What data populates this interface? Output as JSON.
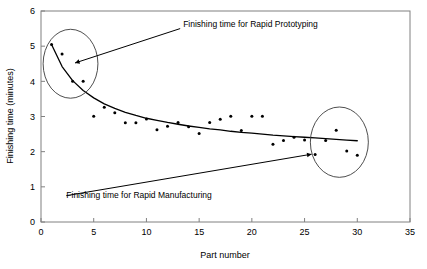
{
  "chart_data": {
    "type": "scatter",
    "title": "",
    "xlabel": "Part number",
    "ylabel": "Finishing time (minutes)",
    "xlim": [
      0,
      35
    ],
    "ylim": [
      0,
      6
    ],
    "xticks": [
      0,
      5,
      10,
      15,
      20,
      25,
      30,
      35
    ],
    "yticks": [
      0,
      1,
      2,
      3,
      4,
      5,
      6
    ],
    "grid": false,
    "legend": "none",
    "series": [
      {
        "name": "Finishing time",
        "marker": "point",
        "color": "#000000",
        "x": [
          1,
          2,
          3,
          4,
          5,
          6,
          7,
          8,
          9,
          10,
          11,
          12,
          13,
          14,
          15,
          16,
          17,
          18,
          19,
          20,
          21,
          22,
          23,
          24,
          25,
          26,
          27,
          28,
          29,
          30
        ],
        "y": [
          5.05,
          4.78,
          4.0,
          4.0,
          3.01,
          3.26,
          3.11,
          2.82,
          2.82,
          2.93,
          2.62,
          2.72,
          2.83,
          2.71,
          2.52,
          2.83,
          2.92,
          3.01,
          2.6,
          3.01,
          3.01,
          2.21,
          2.32,
          2.41,
          2.33,
          1.92,
          2.32,
          2.61,
          2.02,
          1.9
        ]
      }
    ],
    "trend": {
      "name": "Fitted decay curve",
      "color": "#000000",
      "x": [
        1,
        2,
        3,
        4,
        5,
        6,
        7,
        8,
        9,
        10,
        11,
        12,
        13,
        14,
        15,
        16,
        17,
        18,
        19,
        20,
        21,
        22,
        23,
        24,
        25,
        26,
        27,
        28,
        29,
        30
      ],
      "y": [
        5.05,
        4.42,
        4.02,
        3.74,
        3.53,
        3.36,
        3.23,
        3.12,
        3.03,
        2.95,
        2.89,
        2.83,
        2.78,
        2.73,
        2.69,
        2.65,
        2.62,
        2.58,
        2.55,
        2.53,
        2.5,
        2.47,
        2.45,
        2.43,
        2.41,
        2.39,
        2.37,
        2.35,
        2.33,
        2.31
      ]
    },
    "annotations": [
      {
        "id": "rapid-prototyping",
        "text": "Finishing time for Rapid Prototyping",
        "text_x": 13.2,
        "text_y": 5.5,
        "target_x": 3.0,
        "target_y": 4.5,
        "highlight": {
          "cx": 2.8,
          "cy": 4.5,
          "rx": 2.6,
          "ry": 0.98
        }
      },
      {
        "id": "rapid-manufacturing",
        "text": "Finishing time for Rapid Manufacturing",
        "text_x": 2.4,
        "text_y": 0.75,
        "target_x": 25.9,
        "target_y": 1.94,
        "highlight": {
          "cx": 28.3,
          "cy": 2.27,
          "rx": 2.75,
          "ry": 1.0
        }
      }
    ]
  }
}
